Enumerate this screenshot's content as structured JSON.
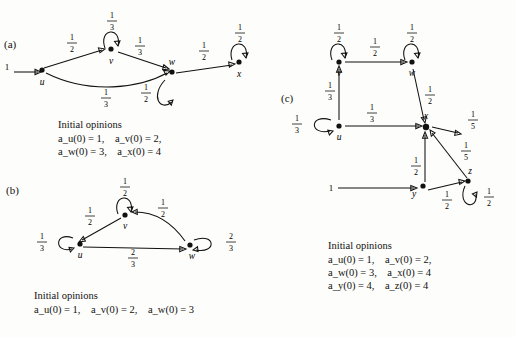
{
  "figure": {
    "panels": [
      {
        "id": "a",
        "label": "(a)",
        "nodes": [
          {
            "id": "u",
            "label": "u"
          },
          {
            "id": "v",
            "label": "v"
          },
          {
            "id": "w",
            "label": "w"
          },
          {
            "id": "x",
            "label": "x"
          }
        ],
        "input_label": "1",
        "edge_weights": [
          "1/2",
          "1/3",
          "1/3",
          "1/3",
          "1/2",
          "1/2",
          "1/2"
        ],
        "caption_title": "Initial opinions",
        "caption_lines": [
          "a_u(0) = 1,    a_v(0) = 2,",
          "a_w(0) = 3,    a_x(0) = 4"
        ]
      },
      {
        "id": "b",
        "label": "(b)",
        "nodes": [
          {
            "id": "u",
            "label": "u"
          },
          {
            "id": "v",
            "label": "v"
          },
          {
            "id": "w",
            "label": "w"
          }
        ],
        "edge_weights": [
          "1/3",
          "1/2",
          "1/2",
          "2/3",
          "2/3"
        ],
        "caption_title": "Initial opinions",
        "caption_lines": [
          "a_u(0) = 1,    a_v(0) = 2,    a_w(0) = 3"
        ]
      },
      {
        "id": "c",
        "label": "(c)",
        "nodes": [
          {
            "id": "u",
            "label": "u"
          },
          {
            "id": "v",
            "label": "v"
          },
          {
            "id": "w",
            "label": "w"
          },
          {
            "id": "x",
            "label": "x"
          },
          {
            "id": "y",
            "label": "y"
          },
          {
            "id": "z",
            "label": "z"
          }
        ],
        "input_labels": [
          "1",
          "1"
        ],
        "edge_weights": [
          "1/2",
          "1/2",
          "1/2",
          "1/2",
          "1/3",
          "1/3",
          "1/5",
          "1/5",
          "1/2",
          "1/2",
          "1/2"
        ],
        "caption_title": "Initial opinions",
        "caption_lines": [
          "a_u(0) = 1,    a_v(0) = 2,",
          "a_w(0) = 3,    a_x(0) = 4",
          "a_y(0) = 4,    a_z(0) = 4"
        ]
      }
    ],
    "fractions": {
      "half": {
        "num": "1",
        "den": "2"
      },
      "third": {
        "num": "1",
        "den": "3"
      },
      "twothirds": {
        "num": "2",
        "den": "3"
      },
      "fifth": {
        "num": "1",
        "den": "5"
      }
    },
    "text": {
      "initial_opinions": "Initial opinions",
      "a_caption_l1": "a",
      "one": "1"
    }
  }
}
